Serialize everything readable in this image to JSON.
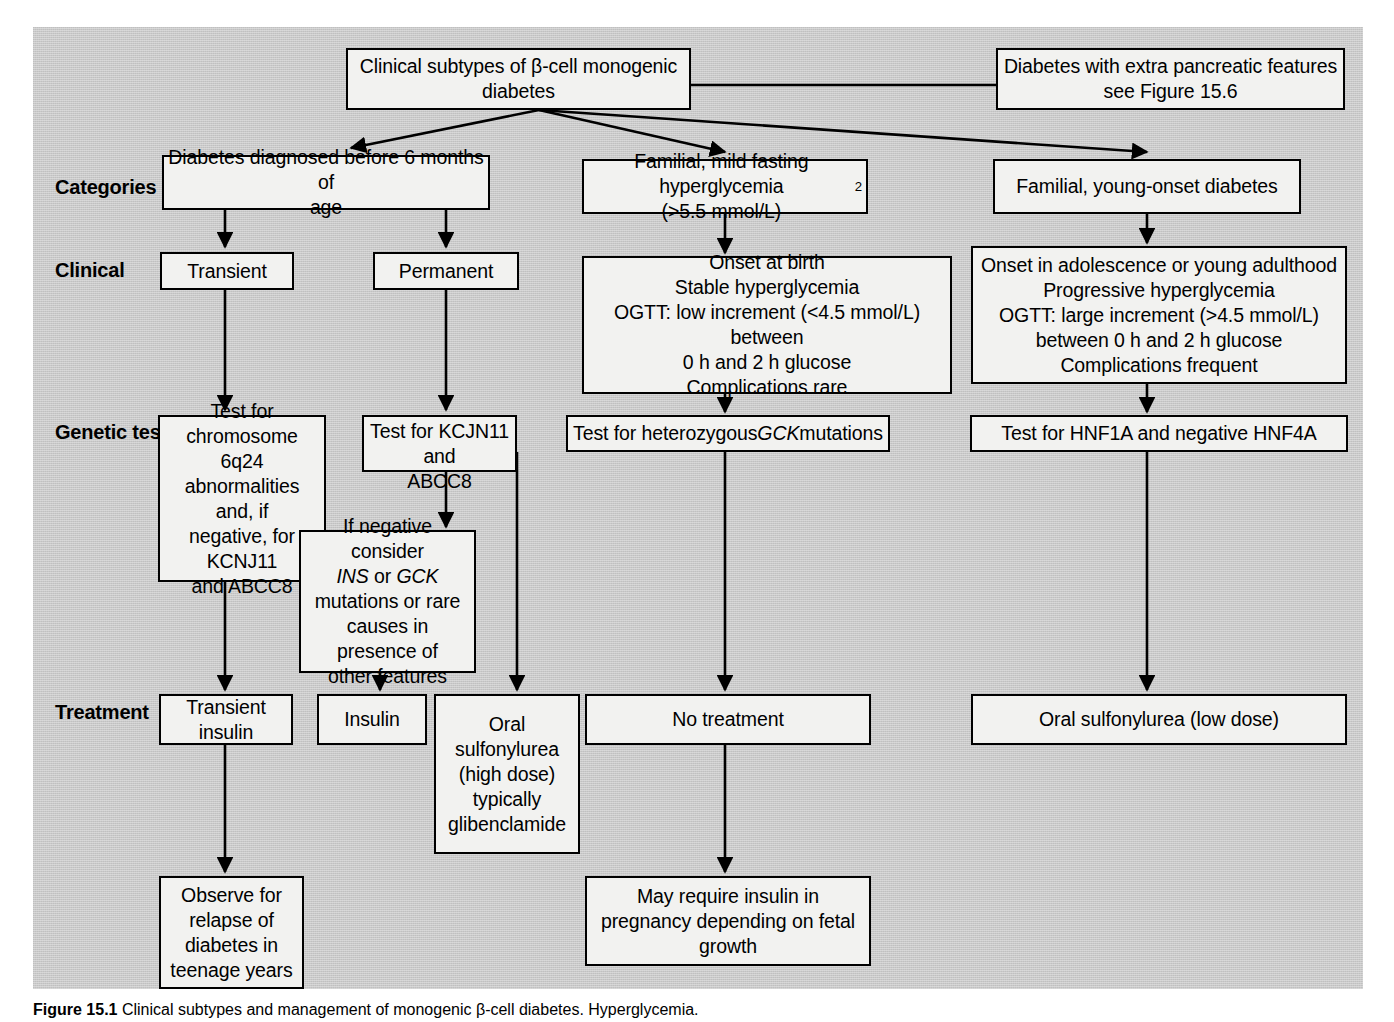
{
  "figure": {
    "caption_label": "Figure 15.1",
    "caption_text": "Clinical subtypes and management of monogenic β-cell diabetes. Hyperglycemia."
  },
  "row_labels": [
    {
      "id": "categories",
      "text": "Categories"
    },
    {
      "id": "clinical",
      "text": "Clinical"
    },
    {
      "id": "genetic-test",
      "text": "Genetic test"
    },
    {
      "id": "treatment",
      "text": "Treatment"
    }
  ],
  "nodes": {
    "root": "Clinical subtypes of β-cell monogenic\ndiabetes",
    "extra_pancreatic": "Diabetes with extra pancreatic features\nsee Figure 15.6",
    "cat_neonatal": "Diabetes diagnosed before 6 months of\nage",
    "cat_familial_mild": "Familial, mild fasting hyperglycemia\n(>5.5 mmol/L)",
    "cat_familial_mild_sup": "2",
    "cat_familial_young": "Familial, young-onset diabetes",
    "clin_transient": "Transient",
    "clin_permanent": "Permanent",
    "clin_gck": "Onset at birth\nStable hyperglycemia\nOGTT: low increment (<4.5 mmol/L) between\n0 h and 2 h glucose\nComplications rare",
    "clin_hnf": "Onset in adolescence or young adulthood\nProgressive hyperglycemia\nOGTT: large increment (>4.5 mmol/L)\nbetween 0 h and 2 h glucose\nComplications frequent",
    "gen_6q24": "Test for\nchromosome 6q24\nabnormalities and, if\nnegative, for KCNJ11\nand ABCC8",
    "gen_kcjn11": "Test for KCJN11 and\nABCC8",
    "gen_gck_pre": "Test for heterozygous ",
    "gen_gck_italic": "GCK",
    "gen_gck_post": " mutations",
    "gen_hnf": "Test for HNF1A and negative HNF4A",
    "gen_if_negative_l1": "If negative consider",
    "gen_if_negative_ins": "INS",
    "gen_if_negative_or": " or ",
    "gen_if_negative_gck": "GCK",
    "gen_if_negative_l3": "mutations or rare\ncauses in presence of\nother features",
    "tx_transient_insulin": "Transient\ninsulin",
    "tx_insulin": "Insulin",
    "tx_oral_high": "Oral\nsulfonylurea\n(high dose)\ntypically\nglibenclamide",
    "tx_no_treatment": "No treatment",
    "tx_oral_low": "Oral sulfonylurea (low dose)",
    "out_observe": "Observe for\nrelapse of\ndiabetes in\nteenage years",
    "out_pregnancy": "May require insulin in\npregnancy depending on fetal\ngrowth"
  },
  "colors": {
    "panel_background": "#c9c9c9",
    "node_fill": "#f2f2f0",
    "node_border": "#000000",
    "connector": "#000000",
    "text": "#000000"
  }
}
